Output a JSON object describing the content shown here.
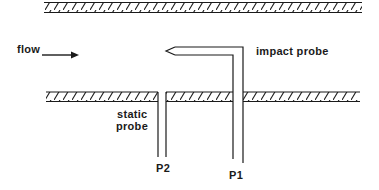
{
  "diagram": {
    "type": "pitot-tube-schematic",
    "labels": {
      "flow": "flow",
      "impact_probe": "impact probe",
      "static_line1": "static",
      "static_line2": "probe",
      "p1": "P1",
      "p2": "P2"
    },
    "icons": {
      "flow_arrow": "right-arrow"
    },
    "colors": {
      "ink": "#1a1a1a",
      "background": "#ffffff"
    }
  }
}
